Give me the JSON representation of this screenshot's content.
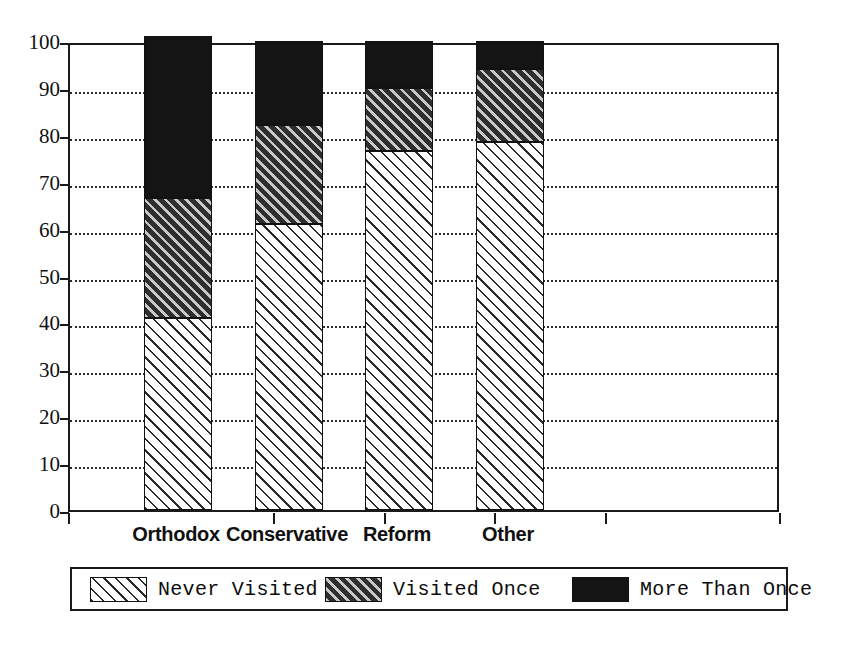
{
  "chart_data": {
    "type": "bar",
    "stacked": true,
    "title": "",
    "subtitle": "",
    "xlabel": "",
    "ylabel": "",
    "categories": [
      "Orthodox",
      "Conservative",
      "Reform",
      "Other"
    ],
    "series": [
      {
        "name": "Never Visited",
        "values": [
          41,
          61,
          76.5,
          78.5
        ],
        "pattern": "diagonal-hatch-light",
        "color": "#ffffff"
      },
      {
        "name": "Visited Once",
        "values": [
          25.5,
          21,
          13.5,
          15.5
        ],
        "pattern": "diagonal-hatch-dark",
        "color": "#2e2e2e"
      },
      {
        "name": "More Than Once",
        "values": [
          34.5,
          18,
          10,
          6
        ],
        "pattern": "solid",
        "color": "#141414"
      }
    ],
    "cumulative_tops": [
      [
        41,
        66.5,
        101
      ],
      [
        61,
        82,
        100
      ],
      [
        76.5,
        90,
        100
      ],
      [
        78.5,
        94,
        100
      ]
    ],
    "ylim": [
      0,
      100
    ],
    "ytick_values": [
      0,
      10,
      20,
      30,
      40,
      50,
      60,
      70,
      80,
      90,
      100
    ],
    "ytick_labels": [
      "0",
      "10",
      "20",
      "30",
      "40",
      "50",
      "60",
      "70",
      "80",
      "90",
      "100"
    ],
    "grid": true,
    "grid_style": "dotted",
    "legend_position": "bottom"
  },
  "legend": {
    "items": [
      {
        "label": "Never Visited",
        "swatch": "hatch-light-swatch"
      },
      {
        "label": "Visited Once",
        "swatch": "hatch-dark-swatch"
      },
      {
        "label": "More Than Once",
        "swatch": "solid-black-swatch"
      }
    ]
  },
  "axes": {
    "y": {
      "labels": [
        "100",
        "90",
        "80",
        "70",
        "60",
        "50",
        "40",
        "30",
        "20",
        "10",
        "0"
      ]
    },
    "x": {
      "labels": [
        "Orthodox",
        "Conservative",
        "Reform",
        "Other"
      ]
    }
  },
  "colors": {
    "axis": "#1a1a1a",
    "grid": "#2b2b2b",
    "never_visited": "#ffffff",
    "visited_once": "#2e2e2e",
    "more_than_once": "#141414",
    "background": "#ffffff"
  }
}
